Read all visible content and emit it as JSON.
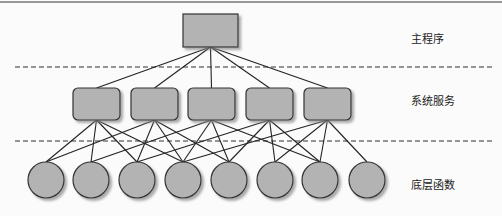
{
  "diagram": {
    "type": "layered-hierarchy",
    "layers": [
      {
        "id": "main",
        "label": "主程序",
        "nodes": 1,
        "shape": "rectangle"
      },
      {
        "id": "services",
        "label": "系统服务",
        "nodes": 5,
        "shape": "rounded-rectangle"
      },
      {
        "id": "functions",
        "label": "底层函数",
        "nodes": 8,
        "shape": "circle"
      }
    ],
    "node_fill": "#b3b3b3",
    "edge_color": "#222222",
    "separator_style": "dashed",
    "edges_main_to_services": [
      [
        0,
        0
      ],
      [
        0,
        1
      ],
      [
        0,
        2
      ],
      [
        0,
        3
      ],
      [
        0,
        4
      ]
    ],
    "edges_services_to_functions": [
      [
        0,
        0
      ],
      [
        0,
        2
      ],
      [
        0,
        3
      ],
      [
        0,
        1
      ],
      [
        1,
        0
      ],
      [
        1,
        3
      ],
      [
        1,
        4
      ],
      [
        1,
        2
      ],
      [
        2,
        1
      ],
      [
        2,
        3
      ],
      [
        2,
        4
      ],
      [
        2,
        6
      ],
      [
        3,
        2
      ],
      [
        3,
        5
      ],
      [
        3,
        6
      ],
      [
        3,
        4
      ],
      [
        4,
        3
      ],
      [
        4,
        6
      ],
      [
        4,
        7
      ],
      [
        4,
        5
      ]
    ]
  }
}
